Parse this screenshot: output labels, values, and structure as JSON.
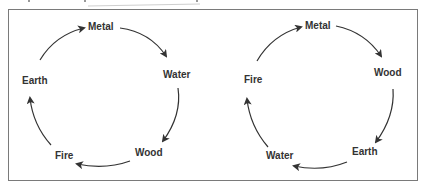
{
  "diagram": {
    "type": "cycle-diagrams",
    "cycles": [
      {
        "name": "left-cycle",
        "nodes": [
          "Metal",
          "Water",
          "Wood",
          "Fire",
          "Earth"
        ],
        "direction": "clockwise",
        "edges": [
          [
            "Metal",
            "Water"
          ],
          [
            "Water",
            "Wood"
          ],
          [
            "Wood",
            "Fire"
          ],
          [
            "Fire",
            "Earth"
          ],
          [
            "Earth",
            "Metal"
          ]
        ]
      },
      {
        "name": "right-cycle",
        "nodes": [
          "Metal",
          "Wood",
          "Earth",
          "Water",
          "Fire"
        ],
        "direction": "clockwise",
        "edges": [
          [
            "Metal",
            "Wood"
          ],
          [
            "Wood",
            "Earth"
          ],
          [
            "Earth",
            "Water"
          ],
          [
            "Water",
            "Fire"
          ],
          [
            "Fire",
            "Metal"
          ]
        ]
      }
    ]
  },
  "labels": {
    "left": {
      "metal": "Metal",
      "water": "Water",
      "wood": "Wood",
      "fire": "Fire",
      "earth": "Earth"
    },
    "right": {
      "metal": "Metal",
      "wood": "Wood",
      "earth": "Earth",
      "water": "Water",
      "fire": "Fire"
    }
  },
  "colors": {
    "line": "#333333",
    "text": "#333333",
    "frame": "#7a7a7a"
  }
}
